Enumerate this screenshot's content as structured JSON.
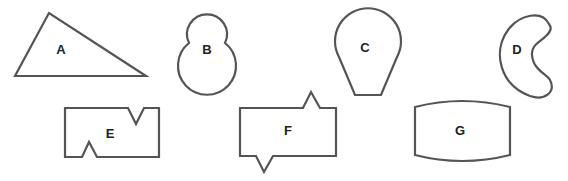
{
  "figure": {
    "stroke_color": "#555555",
    "label_color": "#222222",
    "shapes": [
      {
        "id": "A",
        "label": "A",
        "kind": "scalene-triangle"
      },
      {
        "id": "B",
        "label": "B",
        "kind": "two-overlapping-circles (snowman)"
      },
      {
        "id": "C",
        "label": "C",
        "kind": "teardrop / balloon with flat bottom"
      },
      {
        "id": "D",
        "label": "D",
        "kind": "kidney / bean"
      },
      {
        "id": "E",
        "label": "E",
        "kind": "rectangle with V-notch top and inverted V-notch bottom"
      },
      {
        "id": "F",
        "label": "F",
        "kind": "rectangle with spike top and spike bottom"
      },
      {
        "id": "G",
        "label": "G",
        "kind": "rectangle with convex top and bottom edges"
      }
    ]
  }
}
